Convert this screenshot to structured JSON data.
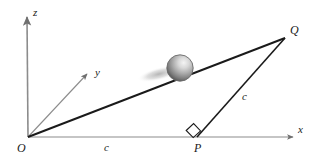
{
  "figure": {
    "background_color": "#ffffff",
    "line_color": "#1a1a1a",
    "axis_color": "#8c8c8c",
    "sphere_light_color": "#f0f0f0",
    "sphere_mid_color": "#9a9a9a",
    "sphere_dark_color": "#5a5a5a",
    "shadow_color": "#bdbdbd"
  },
  "axes": [
    {
      "id": "z",
      "label": "z",
      "label_x": 33,
      "label_y": 16,
      "from_x": 28,
      "from_y": 137,
      "to_x": 27,
      "to_y": 14
    },
    {
      "id": "y",
      "label": "y",
      "label_x": 95,
      "label_y": 76,
      "from_x": 28,
      "from_y": 137,
      "to_x": 89,
      "to_y": 72
    },
    {
      "id": "x",
      "label": "x",
      "label_x": 298,
      "label_y": 133,
      "from_x": 28,
      "from_y": 137,
      "to_x": 296,
      "to_y": 137
    }
  ],
  "points": [
    {
      "id": "O",
      "label": "O",
      "x": 28,
      "y": 137,
      "label_x": 17,
      "label_y": 152
    },
    {
      "id": "P",
      "label": "P",
      "x": 197,
      "y": 137,
      "label_x": 194,
      "label_y": 152
    },
    {
      "id": "Q",
      "label": "Q",
      "x": 285,
      "y": 38,
      "label_x": 290,
      "label_y": 34
    }
  ],
  "segments": [
    {
      "id": "OQ",
      "from": "O",
      "to": "Q",
      "label": "",
      "label_x": 0,
      "label_y": 0
    },
    {
      "id": "PQ",
      "from": "P",
      "to": "Q",
      "label": "c",
      "label_x": 242,
      "label_y": 100
    },
    {
      "id": "OP",
      "from": "O",
      "to": "P",
      "label": "c",
      "label_x": 104,
      "label_y": 151
    }
  ],
  "right_angle": {
    "id": "right-angle-at-P",
    "vertex_x": 197,
    "vertex_y": 137,
    "size": 11
  },
  "sphere": {
    "id": "sphere-on-line",
    "center_x": 180,
    "center_y": 68,
    "radius": 13,
    "highlight_x": 185,
    "highlight_y": 61
  },
  "shadow": {
    "id": "sphere-shadow",
    "center_x": 159,
    "center_y": 74,
    "rx": 22,
    "ry": 6,
    "rotation": -14
  }
}
